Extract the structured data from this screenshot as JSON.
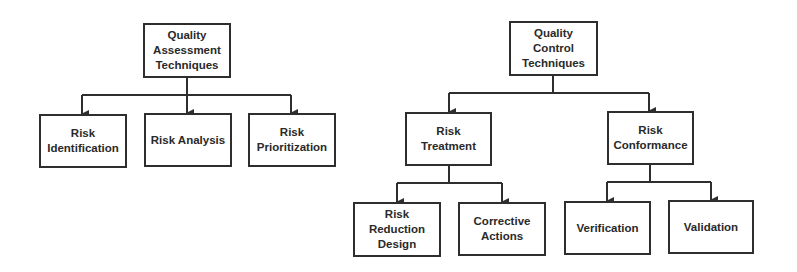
{
  "diagram": {
    "type": "hierarchy",
    "trees": [
      {
        "root": {
          "id": "qat",
          "label": "Quality\nAssessment\nTechniques"
        },
        "children": [
          {
            "id": "risk-identification",
            "label": "Risk\nIdentification"
          },
          {
            "id": "risk-analysis",
            "label": "Risk Analysis"
          },
          {
            "id": "risk-prioritization",
            "label": "Risk\nPrioritization"
          }
        ]
      },
      {
        "root": {
          "id": "qct",
          "label": "Quality\nControl\nTechniques"
        },
        "children": [
          {
            "id": "risk-treatment",
            "label": "Risk\nTreatment",
            "children": [
              {
                "id": "risk-reduction-design",
                "label": "Risk\nReduction\nDesign"
              },
              {
                "id": "corrective-actions",
                "label": "Corrective\nActions"
              }
            ]
          },
          {
            "id": "risk-conformance",
            "label": "Risk\nConformance",
            "children": [
              {
                "id": "verification",
                "label": "Verification"
              },
              {
                "id": "validation",
                "label": "Validation"
              }
            ]
          }
        ]
      }
    ]
  },
  "nodes": {
    "qat": {
      "label": "Quality\nAssessment\nTechniques"
    },
    "risk_identification": {
      "label": "Risk\nIdentification"
    },
    "risk_analysis": {
      "label": "Risk Analysis"
    },
    "risk_prioritization": {
      "label": "Risk\nPrioritization"
    },
    "qct": {
      "label": "Quality\nControl\nTechniques"
    },
    "risk_treatment": {
      "label": "Risk\nTreatment"
    },
    "risk_conformance": {
      "label": "Risk\nConformance"
    },
    "risk_reduction_design": {
      "label": "Risk\nReduction\nDesign"
    },
    "corrective_actions": {
      "label": "Corrective\nActions"
    },
    "verification": {
      "label": "Verification"
    },
    "validation": {
      "label": "Validation"
    }
  },
  "colors": {
    "line": "#2e2e2e",
    "text": "#2a2a2a",
    "background": "#ffffff"
  }
}
